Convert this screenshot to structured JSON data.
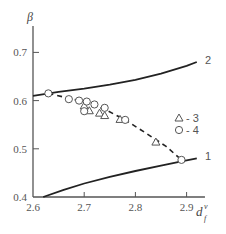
{
  "chart_data": {
    "type": "scatter",
    "title": "",
    "ylabel": "β",
    "xlabel": "d_f^v",
    "xlabel_main": "d",
    "xlabel_sup": "v",
    "xlabel_sub": "f",
    "xlim": [
      2.6,
      2.93
    ],
    "ylim": [
      0.4,
      0.75
    ],
    "xticks": [
      2.6,
      2.7,
      2.8,
      2.9
    ],
    "xtick_labels": [
      "2.6",
      "2.7",
      "2.8",
      "2.9"
    ],
    "yticks": [
      0.4,
      0.5,
      0.6,
      0.7
    ],
    "ytick_labels": [
      "0.4",
      "0.5",
      "0.6",
      "0.7"
    ],
    "grid": false,
    "legend_position": "right-middle",
    "curves": [
      {
        "name": "1",
        "style": "solid",
        "x": [
          2.62,
          2.66,
          2.7,
          2.75,
          2.8,
          2.85,
          2.89,
          2.92
        ],
        "y": [
          0.4,
          0.415,
          0.428,
          0.442,
          0.454,
          0.465,
          0.474,
          0.48
        ]
      },
      {
        "name": "2",
        "style": "solid",
        "x": [
          2.6,
          2.65,
          2.7,
          2.75,
          2.8,
          2.85,
          2.9,
          2.92
        ],
        "y": [
          0.61,
          0.618,
          0.625,
          0.633,
          0.643,
          0.656,
          0.672,
          0.68
        ]
      },
      {
        "name": "fit",
        "style": "dashed",
        "x": [
          2.63,
          2.67,
          2.7,
          2.74,
          2.78,
          2.82,
          2.86,
          2.89
        ],
        "y": [
          0.615,
          0.605,
          0.597,
          0.582,
          0.56,
          0.533,
          0.505,
          0.477
        ]
      }
    ],
    "series": [
      {
        "name": "3",
        "marker": "triangle",
        "x": [
          2.7,
          2.71,
          2.73,
          2.74,
          2.77,
          2.84
        ],
        "y": [
          0.59,
          0.58,
          0.575,
          0.57,
          0.562,
          0.515
        ]
      },
      {
        "name": "4",
        "marker": "circle",
        "x": [
          2.63,
          2.67,
          2.69,
          2.705,
          2.72,
          2.7,
          2.74,
          2.78,
          2.89
        ],
        "y": [
          0.615,
          0.603,
          0.6,
          0.598,
          0.592,
          0.578,
          0.585,
          0.56,
          0.477
        ]
      }
    ],
    "legend": [
      {
        "marker": "triangle",
        "label": "- 3"
      },
      {
        "marker": "circle",
        "label": "- 4"
      }
    ],
    "curve_labels": [
      {
        "text": "1",
        "x": 2.94,
        "y": 0.483
      },
      {
        "text": "2",
        "x": 2.94,
        "y": 0.692
      }
    ]
  }
}
